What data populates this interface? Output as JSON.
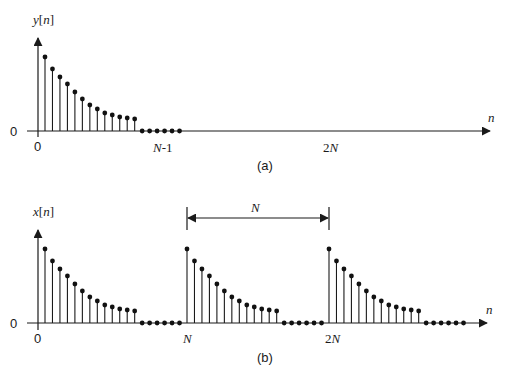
{
  "chart_data": [
    {
      "type": "stem",
      "title": "(a)",
      "ylabel": "y[n]",
      "xlabel": "n",
      "y_zero_label": "0",
      "tick_labels": [
        {
          "n": 0,
          "label": "0"
        },
        {
          "n": 17,
          "label": "N-1"
        },
        {
          "n": 38,
          "label": "2N"
        }
      ],
      "description": "Finite-length sequence y[n], nonzero for n=0..12 (decaying), zero for n=13..18 (N=19)",
      "N": 19,
      "values": [
        74,
        62,
        54,
        47,
        39,
        32,
        26,
        22,
        18,
        16,
        14,
        13,
        12,
        0,
        0,
        0,
        0,
        0,
        0
      ]
    },
    {
      "type": "stem",
      "title": "(b)",
      "ylabel": "x[n]",
      "xlabel": "n",
      "y_zero_label": "0",
      "tick_labels": [
        {
          "n": 0,
          "label": "0"
        },
        {
          "n": 19,
          "label": "N"
        },
        {
          "n": 38,
          "label": "2N"
        }
      ],
      "period_annotation": {
        "label": "N",
        "from_n": 19,
        "to_n": 38
      },
      "description": "Periodic extension x[n] of y[n] with period N, three periods shown",
      "N": 19,
      "periods": 3,
      "values_per_period": [
        74,
        62,
        54,
        47,
        39,
        32,
        26,
        22,
        18,
        16,
        14,
        13,
        12,
        0,
        0,
        0,
        0,
        0,
        0
      ]
    }
  ],
  "labels": {
    "top_ylabel_y": "y",
    "top_ylabel_n": "[n]",
    "bottom_ylabel_x": "x",
    "bottom_ylabel_n": "[n]",
    "axis_n": "n",
    "zero": "0",
    "N_minus_1_N": "N",
    "N_minus_1_suffix": "-1",
    "two_N": "2N",
    "N": "N",
    "caption_a": "(a)",
    "caption_b": "(b)",
    "period_label": "N"
  }
}
